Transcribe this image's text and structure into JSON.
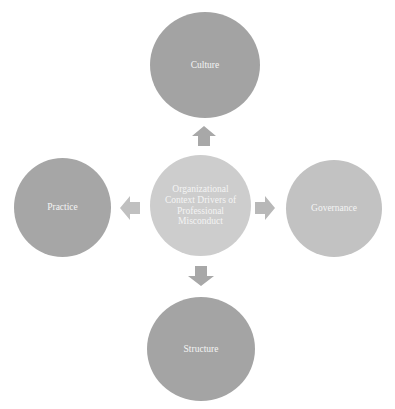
{
  "diagram": {
    "center": {
      "label": "Organizational Context Drivers of Professional Misconduct",
      "color": "#cdcdcd"
    },
    "nodes": [
      {
        "id": "culture",
        "label": "Culture",
        "position": "top",
        "color": "#a3a3a3"
      },
      {
        "id": "practice",
        "label": "Practice",
        "position": "left",
        "color": "#a6a6a6"
      },
      {
        "id": "governance",
        "label": "Governance",
        "position": "right",
        "color": "#c2c2c2"
      },
      {
        "id": "structure",
        "label": "Structure",
        "position": "bottom",
        "color": "#a4a4a4"
      }
    ],
    "arrows": [
      {
        "direction": "up",
        "color": "#a8a8a8"
      },
      {
        "direction": "left",
        "color": "#c0c0c0"
      },
      {
        "direction": "right",
        "color": "#b8b8b8"
      },
      {
        "direction": "down",
        "color": "#a8a8a8"
      }
    ],
    "text_color": "#f4f4f4"
  }
}
